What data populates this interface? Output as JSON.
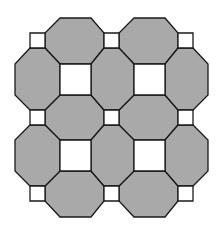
{
  "diagram": {
    "title": "",
    "type": "truncated-square tiling patch (octagons with large and small squares)",
    "size": {
      "width": 222,
      "height": 228
    },
    "colors": {
      "background": "#ffffff",
      "octagon_fill": "#a9a9a9",
      "square_fill": "#ffffff",
      "stroke": "#1a1a1a"
    },
    "grid": {
      "outer": {
        "left": 15,
        "right": 208,
        "top": 18,
        "bottom": 217
      },
      "small_x": [
        [
          30,
          45
        ],
        [
          104,
          119
        ],
        [
          178,
          193
        ]
      ],
      "small_y": [
        [
          33,
          48
        ],
        [
          110,
          125
        ],
        [
          186,
          201
        ]
      ],
      "big_x": [
        [
          60,
          91
        ],
        [
          134,
          165
        ]
      ],
      "big_y": [
        [
          64,
          95
        ],
        [
          140,
          171
        ]
      ]
    },
    "counts": {
      "octagons": 12,
      "large_squares": 4,
      "small_squares": 9
    }
  }
}
